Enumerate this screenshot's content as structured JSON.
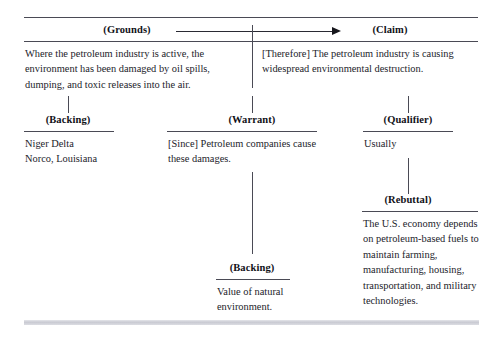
{
  "diagram": {
    "top_rule": true,
    "nodes": {
      "grounds": {
        "label": "(Grounds)",
        "text": "Where the petroleum industry is active, the environment has been damaged by oil spills, dumping, and toxic releases into the air."
      },
      "claim": {
        "label": "(Claim)",
        "text": "[Therefore] The petroleum industry is causing widespread environmental destruction."
      },
      "backing_left": {
        "label": "(Backing)",
        "text_line1": "Niger Delta",
        "text_line2": "Norco, Louisiana"
      },
      "warrant": {
        "label": "(Warrant)",
        "text": "[Since] Petroleum companies cause these damages."
      },
      "qualifier": {
        "label": "(Qualifier)",
        "text": "Usually"
      },
      "rebuttal": {
        "label": "(Rebuttal)",
        "text": "The U.S. economy depends on petroleum-based fuels to maintain farming, manufacturing, housing, transportation, and military technologies."
      },
      "backing_warrant": {
        "label": "(Backing)",
        "text": "Value of natural environment."
      }
    },
    "connector": {
      "name": "grounds-to-claim-arrow",
      "direction": "right"
    },
    "colors": {
      "rule": "#4a4a55",
      "text": "#23232b",
      "label": "#111118",
      "bottom_bar": "#c9cad2",
      "background": "#ffffff"
    }
  }
}
